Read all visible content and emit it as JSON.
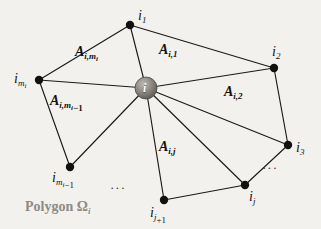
{
  "figure": {
    "caption_word": "Polygon",
    "caption_symbol": "Ω",
    "caption_symbol_sub": "i",
    "hub_letter": "i",
    "background_color": "#f3f1ee",
    "line_color": "#1a1a1a",
    "node_color": "#111111",
    "hub_color": "#8f8c89",
    "caption_color": "#8d8a86"
  },
  "vertices": [
    {
      "id": "i1",
      "base": "i",
      "sub": "1",
      "sub2": "",
      "subtail": "",
      "x": 130,
      "y": 25
    },
    {
      "id": "i2",
      "base": "i",
      "sub": "2",
      "sub2": "",
      "subtail": "",
      "x": 274,
      "y": 68
    },
    {
      "id": "i3",
      "base": "i",
      "sub": "3",
      "sub2": "",
      "subtail": "",
      "x": 288,
      "y": 145
    },
    {
      "id": "ij",
      "base": "i",
      "sub": "j",
      "sub2": "",
      "subtail": "",
      "x": 245,
      "y": 185
    },
    {
      "id": "ij1",
      "base": "i",
      "sub": "j",
      "sub2": "",
      "subtail": "+1",
      "x": 164,
      "y": 200
    },
    {
      "id": "im1",
      "base": "i",
      "sub": "m",
      "sub2": "i",
      "subtail": "−1",
      "x": 70,
      "y": 167
    },
    {
      "id": "imi",
      "base": "i",
      "sub": "m",
      "sub2": "i",
      "subtail": "",
      "x": 39,
      "y": 80
    }
  ],
  "regions": [
    {
      "id": "Aimi",
      "base": "A",
      "sub": "i,m",
      "sub2": "i",
      "subtail": "",
      "x": 82,
      "y": 52
    },
    {
      "id": "Ai1",
      "base": "A",
      "sub": "i,1",
      "sub2": "",
      "subtail": "",
      "x": 163,
      "y": 50
    },
    {
      "id": "Ai2",
      "base": "A",
      "sub": "i,2",
      "sub2": "",
      "subtail": "",
      "x": 228,
      "y": 92
    },
    {
      "id": "Aim1",
      "base": "A",
      "sub": "i,m",
      "sub2": "i",
      "subtail": "−1",
      "x": 57,
      "y": 101
    },
    {
      "id": "Aij",
      "base": "A",
      "sub": "i,j",
      "sub2": "",
      "subtail": "",
      "x": 163,
      "y": 147
    }
  ],
  "ellipses": [
    {
      "id": "ell-bottom",
      "text": "···",
      "x": 110,
      "y": 186
    },
    {
      "id": "ell-right",
      "text": "···",
      "x": 262,
      "y": 166
    }
  ],
  "caption_pos": {
    "x": 25,
    "y": 203
  },
  "hub": {
    "x": 146,
    "y": 88,
    "r": 11
  }
}
